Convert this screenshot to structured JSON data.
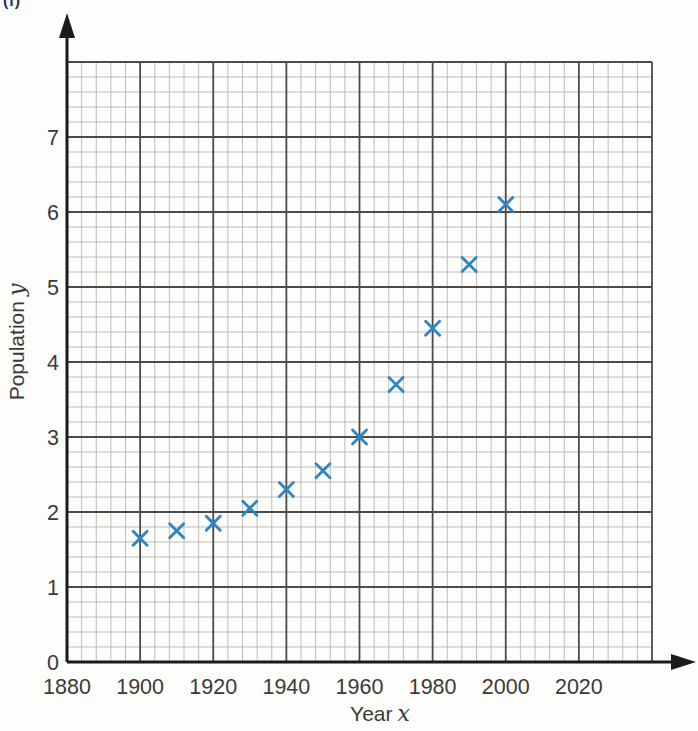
{
  "page_label": {
    "text": "(i)",
    "color": "#27355e"
  },
  "chart_data": {
    "type": "scatter",
    "title": "",
    "xlabel": {
      "text": "Year",
      "var": "x"
    },
    "ylabel": {
      "text": "Population",
      "var": "y"
    },
    "x": [
      1900,
      1910,
      1920,
      1930,
      1940,
      1950,
      1960,
      1970,
      1980,
      1990,
      2000
    ],
    "y": [
      1.65,
      1.75,
      1.85,
      2.05,
      2.3,
      2.55,
      3.0,
      3.7,
      4.45,
      5.3,
      6.1
    ],
    "xlim": [
      1880,
      2040
    ],
    "ylim": [
      0,
      8
    ],
    "x_major_step": 20,
    "y_major_step": 1,
    "minor_divisions_per_major": 5,
    "x_tick_labels": [
      "1880",
      "1900",
      "1920",
      "1940",
      "1960",
      "1980",
      "2000",
      "2020"
    ],
    "x_tick_values": [
      1880,
      1900,
      1920,
      1940,
      1960,
      1980,
      2000,
      2020
    ],
    "y_tick_labels": [
      "0",
      "1",
      "2",
      "3",
      "4",
      "5",
      "6",
      "7"
    ],
    "y_tick_values": [
      0,
      1,
      2,
      3,
      4,
      5,
      6,
      7
    ],
    "marker": "x",
    "grid": "on",
    "legend": "none",
    "colors": {
      "marker": "#2e86c5",
      "grid_minor": "#b9b6b1",
      "grid_major": "#4d4b48",
      "axis": "#1c1b1a",
      "tick_text": "#3b3a38",
      "label_text": "#3b3a38"
    }
  }
}
